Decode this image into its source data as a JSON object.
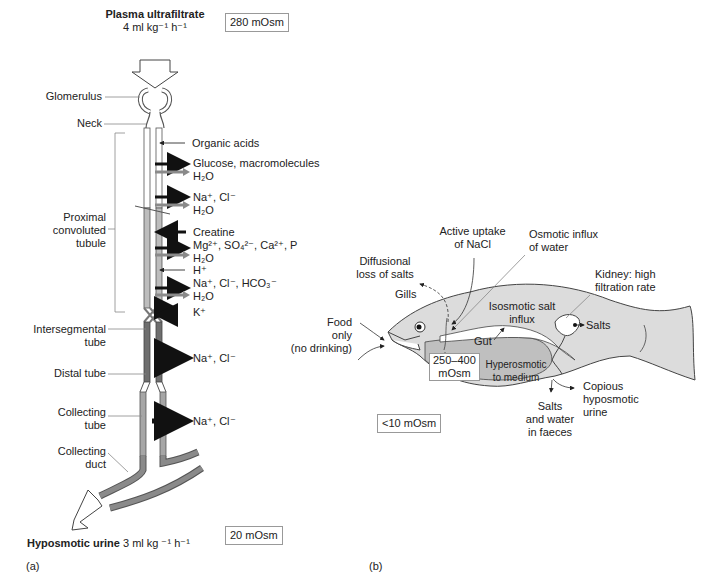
{
  "panel_a": {
    "caption": "(a)",
    "input_title": "Plasma ultrafiltrate",
    "input_rate": "4 ml kg⁻¹ h⁻¹",
    "input_osm": "280 mOsm",
    "output_title": "Hyposmotic urine",
    "output_rate": "3 ml kg ⁻¹ h⁻¹",
    "output_osm": "20 mOsm",
    "segments": {
      "glomerulus": "Glomerulus",
      "neck": "Neck",
      "proximal": [
        "Proximal",
        "convoluted",
        "tubule"
      ],
      "intersegmental": [
        "Intersegmental",
        "tube"
      ],
      "distal": "Distal tube",
      "collecting_tube": [
        "Collecting",
        "tube"
      ],
      "collecting_duct": [
        "Collecting",
        "duct"
      ]
    },
    "transport": {
      "organic_acids": "Organic acids",
      "glucose": "Glucose, macromolecules",
      "h2o_1": "H₂O",
      "nacl_1": "Na⁺, Cl⁻",
      "h2o_2": "H₂O",
      "creatine": "Creatine",
      "mg": "Mg²⁺, SO₄²⁻, Ca²⁺, P",
      "h2o_3": "H₂O",
      "h_plus": "H⁺",
      "na_hco3": "Na⁺, Cl⁻, HCO₃⁻",
      "h2o_4": "H₂O",
      "k_plus": "K⁺",
      "nacl_distal": "Na⁺, Cl⁻",
      "nacl_collecting": "Na⁺, Cl⁻"
    }
  },
  "panel_b": {
    "caption": "(b)",
    "labels": {
      "active_uptake": [
        "Active uptake",
        "of NaCl"
      ],
      "osmotic_influx": [
        "Osmotic influx",
        "of water"
      ],
      "diffusional": [
        "Diffusional",
        "loss of salts"
      ],
      "gills": "Gills",
      "kidney": [
        "Kidney: high",
        "filtration rate"
      ],
      "isosmotic": [
        "Isosmotic salt",
        "influx"
      ],
      "salts_kidney": "Salts",
      "food": [
        "Food",
        "only",
        "(no drinking)"
      ],
      "gut": "Gut",
      "internal_osm": [
        "250–400",
        "mOsm"
      ],
      "hyperosmotic": [
        "Hyperosmotic",
        "to medium"
      ],
      "copious": [
        "Copious",
        "hyposmotic",
        "urine"
      ],
      "faeces": [
        "Salts",
        "and water",
        "in faeces"
      ],
      "medium_osm": "<10 mOsm"
    }
  },
  "colors": {
    "proximal_tube": "#bdbdbd",
    "distal_tube": "#6e6e6e",
    "collecting_tube": "#a6a6a6",
    "fish_body": "#dcdcdc",
    "fish_gut_region": "#bfbfbf",
    "arrow_solute": "#111111",
    "arrow_water": "#8a8a8a"
  }
}
